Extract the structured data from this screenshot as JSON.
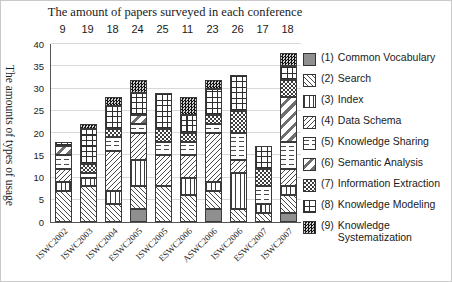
{
  "chart_data": {
    "type": "bar",
    "stacked": true,
    "title": "The amount of papers surveyed in each conference",
    "ylabel": "The amounts of types of usage",
    "ylim": [
      0,
      40
    ],
    "ytick_step": 5,
    "yticks": [
      0,
      5,
      10,
      15,
      20,
      25,
      30,
      35,
      40
    ],
    "grid": true,
    "legend_position": "right",
    "categories": [
      "ISWC2002",
      "ISWC2003",
      "ISWC2004",
      "ESWC2005",
      "ISWC2005",
      "ESWC2006",
      "ASWC2006",
      "ISWC2006",
      "ESWC2007",
      "ISWC2007"
    ],
    "papers_surveyed": [
      9,
      19,
      18,
      24,
      25,
      11,
      23,
      26,
      17,
      18
    ],
    "series": [
      {
        "legend_number": "(1)",
        "name": "Common Vocabulary",
        "pattern": "solid-gray",
        "values": [
          0,
          0,
          0,
          3,
          0,
          0,
          3,
          0,
          0,
          2
        ]
      },
      {
        "legend_number": "(2)",
        "name": "Search",
        "pattern": "diag-back",
        "values": [
          7,
          8,
          4,
          5,
          8,
          6,
          4,
          3,
          2,
          4
        ]
      },
      {
        "legend_number": "(3)",
        "name": "Index",
        "pattern": "vertical-lines",
        "values": [
          2,
          2,
          3,
          6,
          0,
          4,
          2,
          8,
          2,
          2
        ]
      },
      {
        "legend_number": "(4)",
        "name": "Data Schema",
        "pattern": "diag-forward-thin",
        "values": [
          3,
          0,
          9,
          6,
          7,
          5,
          11,
          3,
          0,
          4
        ]
      },
      {
        "legend_number": "(5)",
        "name": "Knowledge Sharing",
        "pattern": "wavy",
        "values": [
          3,
          1,
          3,
          2,
          3,
          3,
          2,
          6,
          4,
          6
        ]
      },
      {
        "legend_number": "(6)",
        "name": "Semantic Analysis",
        "pattern": "diag-forward-wide",
        "values": [
          2,
          0,
          0,
          2,
          0,
          0,
          0,
          0,
          0,
          10
        ]
      },
      {
        "legend_number": "(7)",
        "name": "Information Extraction",
        "pattern": "checker-small",
        "values": [
          0,
          2,
          2,
          0,
          3,
          2,
          2,
          5,
          4,
          4
        ]
      },
      {
        "legend_number": "(8)",
        "name": "Knowledge Modeling",
        "pattern": "grid-open",
        "values": [
          1,
          8,
          5,
          5,
          8,
          4,
          6,
          8,
          5,
          3
        ]
      },
      {
        "legend_number": "(9)",
        "name": "Knowledge Systematization",
        "pattern": "checker-dark",
        "values": [
          0,
          1,
          2,
          3,
          0,
          4,
          2,
          0,
          0,
          3
        ]
      }
    ],
    "stack_totals": [
      18,
      22,
      28,
      32,
      29,
      28,
      32,
      33,
      17,
      38
    ]
  }
}
